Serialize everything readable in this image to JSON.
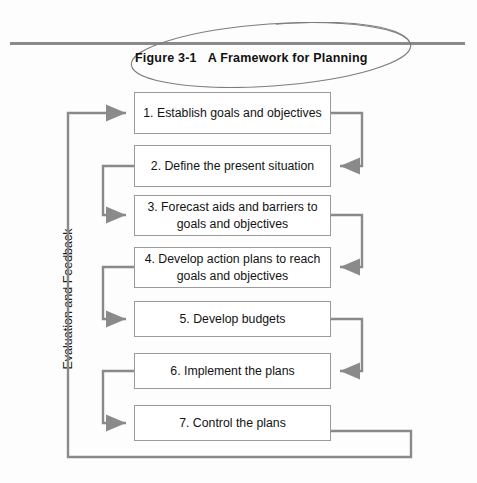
{
  "figure": {
    "caption_number": "Figure 3-1",
    "caption_title": "A Framework for Planning",
    "side_label": "Evaluation and Feedback",
    "annotation": "hand-drawn-ellipse-around-caption",
    "line_color": "#8a8a8a",
    "box_border_color": "#9a9a9a",
    "text_color": "#131313",
    "background": "#fdfdfd"
  },
  "steps": [
    {
      "number": "1.",
      "text": "Establish goals and objectives"
    },
    {
      "number": "2.",
      "text": "Define the present situation"
    },
    {
      "number": "3.",
      "text": "Forecast aids and barriers to goals and objectives"
    },
    {
      "number": "4.",
      "text": "Develop action plans to reach goals and objectives"
    },
    {
      "number": "5.",
      "text": "Develop budgets"
    },
    {
      "number": "6.",
      "text": "Implement the plans"
    },
    {
      "number": "7.",
      "text": "Control the plans"
    }
  ],
  "step_labels": [
    "1.  Establish goals and objectives",
    "2.  Define the present situation",
    "3.  Forecast aids and barriers to goals and objectives",
    "4.  Develop action plans to reach goals and objectives",
    "5.  Develop budgets",
    "6.  Implement the plans",
    "7.  Control the plans"
  ],
  "connectors": {
    "right_loops": [
      {
        "from_step": 1,
        "to_step": 2
      },
      {
        "from_step": 3,
        "to_step": 4
      },
      {
        "from_step": 5,
        "to_step": 6
      }
    ],
    "left_loops": [
      {
        "from_step": 2,
        "to_step": 3
      },
      {
        "from_step": 4,
        "to_step": 5
      },
      {
        "from_step": 6,
        "to_step": 7
      }
    ],
    "feedback_loop": {
      "from_step": 7,
      "to_step": 1,
      "label": "Evaluation and Feedback"
    }
  }
}
